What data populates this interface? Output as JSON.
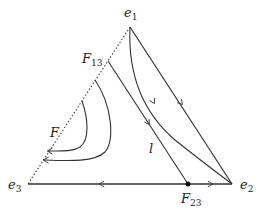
{
  "diagram": {
    "type": "simplex-phase-portrait",
    "vertices": [
      {
        "id": "e1",
        "label": "e",
        "sub": "1",
        "x": 130,
        "y": 27
      },
      {
        "id": "e2",
        "label": "e",
        "sub": "2",
        "x": 232,
        "y": 184
      },
      {
        "id": "e3",
        "label": "e",
        "sub": "3",
        "x": 28,
        "y": 184
      }
    ],
    "points": [
      {
        "id": "F13",
        "label": "F",
        "sub": "13",
        "x": 108,
        "y": 61
      },
      {
        "id": "F23",
        "label": "F",
        "sub": "23",
        "x": 188,
        "y": 184
      }
    ],
    "labels": {
      "F": "F",
      "l": "l"
    },
    "colors": {
      "stroke": "#333333",
      "dotted": "#444444"
    }
  }
}
